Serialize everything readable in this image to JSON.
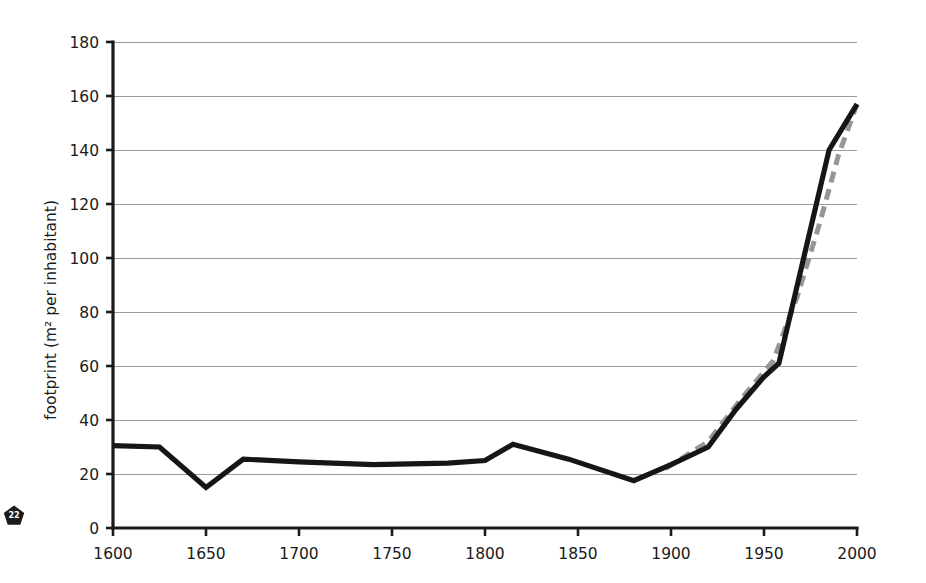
{
  "figure": {
    "page_badge": "22",
    "badge_shape": "pentagon-badge-icon"
  },
  "chart_data": {
    "type": "line",
    "title": "",
    "xlabel": "",
    "ylabel": "footprint (m² per inhabitant)",
    "xlim": [
      1600,
      2000
    ],
    "ylim": [
      0,
      180
    ],
    "grid": true,
    "legend": "none",
    "xticks": [
      1600,
      1650,
      1700,
      1750,
      1800,
      1850,
      1900,
      1950,
      2000
    ],
    "xtick_labels": [
      "1600",
      "1650",
      "1700",
      "1750",
      "1800",
      "1850",
      "1900",
      "1950",
      "2000"
    ],
    "yticks": [
      0,
      20,
      40,
      60,
      80,
      100,
      120,
      140,
      160,
      180
    ],
    "ytick_labels": [
      "0",
      "20",
      "40",
      "60",
      "80",
      "100",
      "120",
      "140",
      "160",
      "180"
    ],
    "series": [
      {
        "name": "footprint-solid",
        "style": "solid",
        "color": "#161616",
        "points": [
          [
            1600,
            30.5
          ],
          [
            1625,
            30.0
          ],
          [
            1650,
            15.0
          ],
          [
            1670,
            25.5
          ],
          [
            1700,
            24.5
          ],
          [
            1740,
            23.5
          ],
          [
            1780,
            24.0
          ],
          [
            1800,
            25.0
          ],
          [
            1815,
            31.0
          ],
          [
            1845,
            25.5
          ],
          [
            1880,
            17.5
          ],
          [
            1900,
            23.5
          ],
          [
            1920,
            30.0
          ],
          [
            1935,
            44.0
          ],
          [
            1950,
            56.0
          ],
          [
            1958,
            61.0
          ],
          [
            1985,
            140.0
          ],
          [
            2000,
            157.0
          ]
        ]
      },
      {
        "name": "footprint-dashed",
        "style": "dashed",
        "color": "#969696",
        "points": [
          [
            1897,
            22.0
          ],
          [
            1920,
            32.0
          ],
          [
            1938,
            48.0
          ],
          [
            1955,
            62.0
          ],
          [
            1968,
            86.0
          ],
          [
            1980,
            113.0
          ],
          [
            1990,
            138.0
          ],
          [
            2000,
            157.0
          ]
        ]
      }
    ]
  }
}
